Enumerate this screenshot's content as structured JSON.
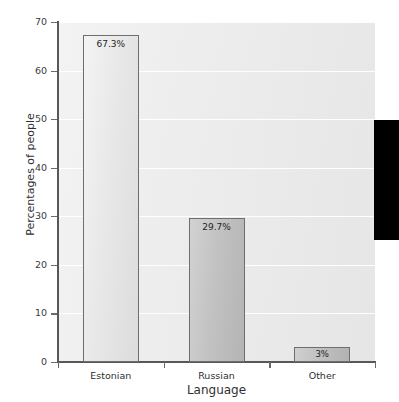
{
  "chart_data": {
    "type": "bar",
    "title": "",
    "categories": [
      "Estonian",
      "Russian",
      "Other"
    ],
    "values": [
      67.3,
      29.7,
      3
    ],
    "data_labels": [
      "67.3%",
      "29.7%",
      "3%"
    ],
    "xlabel": "Language",
    "ylabel": "Percentages of people",
    "ylim": [
      0,
      70
    ],
    "yticks": [
      0,
      10,
      20,
      30,
      40,
      50,
      60,
      70
    ],
    "ytick_labels": [
      "0",
      "10",
      "20",
      "30",
      "40",
      "50",
      "60",
      "70"
    ],
    "grid": "horizontal",
    "legend": "none",
    "series": [
      {
        "name": "Percentages of people",
        "values": [
          67.3,
          29.7,
          3
        ]
      }
    ],
    "colors": {
      "plot_background": "#ececec",
      "gridline": "#ffffff",
      "axis": "#58585a",
      "bar_estonian": "#e9e9e9",
      "bar_russian": "#c2c2c2",
      "bar_other": "#c0c0c0",
      "bar_border": "#6e6e70",
      "text": "#2f2f31",
      "overlay_block": "#000000"
    }
  },
  "overlay": {
    "name": "black-block-artifact"
  }
}
